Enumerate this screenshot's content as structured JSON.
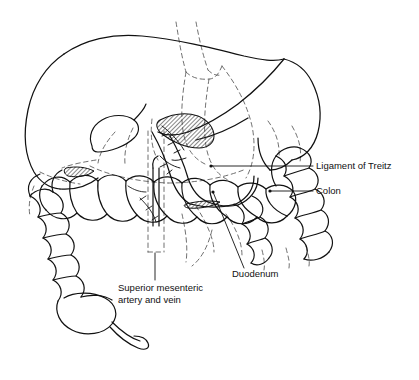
{
  "figure": {
    "background_color": "#ffffff",
    "line_color": "#111111",
    "dashed_line_color": "#555555",
    "hatch_color": "#222222",
    "style": "black-and-white line drawing"
  },
  "labels": [
    {
      "id": "ligament-of-treitz",
      "text": "Ligament of Treitz",
      "text_x": 316,
      "text_y": 169,
      "anchor": "start",
      "leader": {
        "x1": 313,
        "y1": 166,
        "x2": 211,
        "y2": 166
      },
      "dot": {
        "cx": 211,
        "cy": 166,
        "r": 1.6
      }
    },
    {
      "id": "colon",
      "text": "Colon",
      "text_x": 316,
      "text_y": 194,
      "anchor": "start",
      "leader": {
        "x1": 313,
        "y1": 191,
        "x2": 270,
        "y2": 191
      },
      "dot": {
        "cx": 270,
        "cy": 191,
        "r": 1.6
      }
    },
    {
      "id": "duodenum",
      "text": "Duodenum",
      "text_x": 232,
      "text_y": 277,
      "anchor": "start",
      "leader": {
        "x1": 244,
        "y1": 268,
        "x2": 213,
        "y2": 192
      },
      "dot": {
        "cx": 213,
        "cy": 192,
        "r": 1.6
      }
    },
    {
      "id": "superior-mesenteric-artery-and-vein",
      "text_line_1": "Superior mesenteric",
      "text_line_2": "artery and vein",
      "text_x": 118,
      "text_y": 291,
      "text_y2": 303,
      "anchor": "start",
      "leader": {
        "x1": 155,
        "y1": 280,
        "x2": 155,
        "y2": 253
      }
    }
  ],
  "organs": [
    {
      "name": "liver",
      "note": "large smooth lobe occupying upper left"
    },
    {
      "name": "stomach",
      "note": "sweeps from centre to upper right, dashed where hidden"
    },
    {
      "name": "transverse-colon",
      "note": "haustrated sacculated tube across the middle"
    },
    {
      "name": "ascending-colon",
      "note": "right side descending column of haustra"
    },
    {
      "name": "descending-colon",
      "note": "left side column of haustra"
    },
    {
      "name": "cecum",
      "note": "lower left sac"
    },
    {
      "name": "appendix",
      "note": "thin curved tube off the cecum"
    },
    {
      "name": "duodenum",
      "note": "C-loop in the centre"
    },
    {
      "name": "pancreas",
      "note": "head with hatched shading near centre"
    },
    {
      "name": "gallbladder",
      "note": "small pear shape under the liver"
    }
  ]
}
